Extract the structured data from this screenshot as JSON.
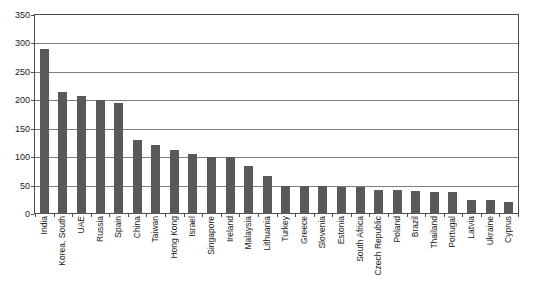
{
  "chart_data": {
    "type": "bar",
    "title": "",
    "xlabel": "",
    "ylabel": "",
    "ylim": [
      0,
      350
    ],
    "ytick_step": 50,
    "yticks": [
      0,
      50,
      100,
      150,
      200,
      250,
      300,
      350
    ],
    "grid": true,
    "legend": "none",
    "bar_color": "#595959",
    "gridline_color": "#7f7f7f",
    "axis_color": "#4d4d4d",
    "categories": [
      "India",
      "Korea, South",
      "UAE",
      "Russia",
      "Spain",
      "China",
      "Taiwan",
      "Hong Kong",
      "Israel",
      "Singapore",
      "Ireland",
      "Malaysia",
      "Lithuania",
      "Turkey",
      "Greece",
      "Slovenia",
      "Estonia",
      "South Africa",
      "Czech Republic",
      "Poland",
      "Brazil",
      "Thailand",
      "Portugal",
      "Latvia",
      "Ukraine",
      "Cyprus"
    ],
    "values": [
      290,
      215,
      207,
      200,
      195,
      130,
      122,
      112,
      105,
      100,
      100,
      85,
      67,
      50,
      50,
      50,
      47,
      47,
      42,
      42,
      40,
      38,
      38,
      25,
      25,
      22
    ]
  }
}
